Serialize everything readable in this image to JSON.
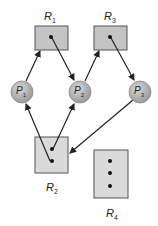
{
  "diagram": {
    "type": "resource-allocation-graph",
    "colors": {
      "resource_fill": "#c8c8c8",
      "resource_fill_light": "#dcdcdc",
      "resource_stroke": "#444444",
      "process_fill": "#b4b4b4",
      "edge": "#222222"
    },
    "resources": [
      {
        "id": "R1",
        "label": "R",
        "sub": "1",
        "instances": 1
      },
      {
        "id": "R2",
        "label": "R",
        "sub": "2",
        "instances": 2
      },
      {
        "id": "R3",
        "label": "R",
        "sub": "3",
        "instances": 1
      },
      {
        "id": "R4",
        "label": "R",
        "sub": "4",
        "instances": 3
      }
    ],
    "processes": [
      {
        "id": "P1",
        "label": "P",
        "sub": "1"
      },
      {
        "id": "P2",
        "label": "P",
        "sub": "2"
      },
      {
        "id": "P3",
        "label": "P",
        "sub": "3"
      }
    ],
    "edges": [
      {
        "from": "P1",
        "to": "R1",
        "kind": "request"
      },
      {
        "from": "R1",
        "to": "P2",
        "kind": "assignment"
      },
      {
        "from": "P2",
        "to": "R3",
        "kind": "request"
      },
      {
        "from": "R3",
        "to": "P3",
        "kind": "assignment"
      },
      {
        "from": "R2",
        "to": "P1",
        "kind": "assignment"
      },
      {
        "from": "R2",
        "to": "P2",
        "kind": "assignment"
      },
      {
        "from": "P3",
        "to": "R2",
        "kind": "request"
      }
    ]
  }
}
